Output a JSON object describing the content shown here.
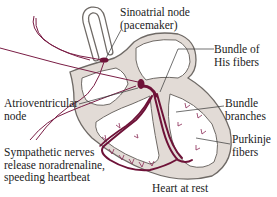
{
  "figure": {
    "clipped_top_text": "",
    "caption": "Heart at rest",
    "colors": {
      "tissue_fill": "#e2dbd6",
      "tissue_outline": "#6f6a66",
      "conduction": "#6e1238",
      "nerve": "#7a1d45",
      "leader_line": "#333333"
    }
  },
  "labels": {
    "sa_node": {
      "line1": "Sinoatrial node",
      "line2": "(pacemaker)"
    },
    "bundle_his": {
      "line1": "Bundle of",
      "line2": "His fibers"
    },
    "av_node": {
      "line1": "Atrioventricular",
      "line2": "node"
    },
    "bundle_branches": {
      "line1": "Bundle",
      "line2": "branches"
    },
    "purkinje": {
      "line1": "Purkinje",
      "line2": "fibers"
    },
    "sympathetic": {
      "line1": "Sympathetic nerves",
      "line2": "release noradrenaline,",
      "line3": "speeding heartbeat"
    }
  }
}
